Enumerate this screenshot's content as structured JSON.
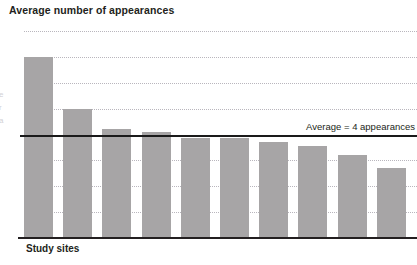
{
  "chart_data": {
    "type": "bar",
    "title": "Average number of appearances",
    "xlabel": "Study sites",
    "ylabel": "",
    "categories": [
      "1",
      "2",
      "3",
      "4",
      "5",
      "6",
      "7",
      "8",
      "9",
      "10"
    ],
    "values": [
      7.0,
      5.0,
      4.2,
      4.1,
      3.85,
      3.85,
      3.7,
      3.55,
      3.2,
      2.7
    ],
    "ylim": [
      0,
      8
    ],
    "yticks": [
      "8",
      "7",
      "6",
      "5",
      "4",
      "3",
      "2",
      "1",
      "0"
    ],
    "ytick_values": [
      8,
      7,
      6,
      5,
      4,
      3,
      2,
      1,
      0
    ],
    "grid": true,
    "legend": "none",
    "annotations": [
      {
        "name": "average-reference-line",
        "label": "Average = 4 appearances",
        "value": 4
      }
    ],
    "series": [
      {
        "name": "Average number of appearances",
        "values": [
          7.0,
          5.0,
          4.2,
          4.1,
          3.85,
          3.85,
          3.7,
          3.55,
          3.2,
          2.7
        ],
        "color": "#a7a5a6"
      }
    ]
  },
  "colors": {
    "bar_fill": "#a7a5a6",
    "axis": "#231f20",
    "gridline": "#b9b6bd",
    "average_line": "#1a1a1a",
    "text": "#231f20",
    "background": "#ffffff"
  },
  "margin_fragment": "e r a"
}
